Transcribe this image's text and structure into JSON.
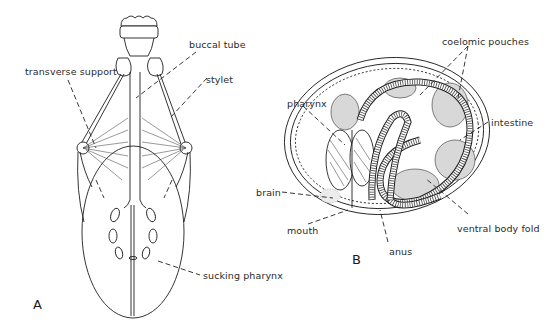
{
  "figure": {
    "panels": [
      {
        "id": "A",
        "label": "A",
        "subject": "tardigrade head / pharyngeal apparatus",
        "callouts": [
          {
            "text": "buccal tube"
          },
          {
            "text": "transverse support"
          },
          {
            "text": "stylet"
          },
          {
            "text": "sucking pharynx"
          }
        ]
      },
      {
        "id": "B",
        "label": "B",
        "subject": "coiled embryo cross-section",
        "callouts": [
          {
            "text": "coelomic pouches"
          },
          {
            "text": "pharynx"
          },
          {
            "text": "intestine"
          },
          {
            "text": "brain"
          },
          {
            "text": "mouth"
          },
          {
            "text": "anus"
          },
          {
            "text": "ventral body fold"
          }
        ]
      }
    ]
  },
  "colors": {
    "background": "#ffffff",
    "ink": "#1e1e1e",
    "shade": "#d8d8d8"
  }
}
